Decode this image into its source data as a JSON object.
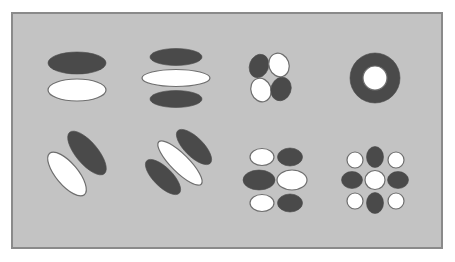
{
  "figure": {
    "width": 455,
    "height": 262,
    "background": "#ffffff",
    "panel": {
      "x": 12,
      "y": 13,
      "width": 430,
      "height": 235,
      "fill": "#c3c3c3",
      "stroke": "#8a8a8a",
      "stroke_width": 2
    },
    "colors": {
      "dark": "#4a4a4a",
      "light": "#ffffff",
      "outline": "#6e6e6e"
    },
    "patterns": [
      {
        "name": "two-lobe-horizontal",
        "shapes": [
          {
            "type": "ellipse",
            "cx": 77,
            "cy": 63,
            "rx": 29,
            "ry": 11,
            "rot": 0,
            "tone": "dark"
          },
          {
            "type": "ellipse",
            "cx": 77,
            "cy": 90,
            "rx": 29,
            "ry": 11,
            "rot": 0,
            "tone": "light"
          }
        ]
      },
      {
        "name": "three-lobe-horizontal",
        "shapes": [
          {
            "type": "ellipse",
            "cx": 176,
            "cy": 57,
            "rx": 26,
            "ry": 8.5,
            "rot": 0,
            "tone": "dark"
          },
          {
            "type": "ellipse",
            "cx": 176,
            "cy": 78,
            "rx": 34,
            "ry": 8.5,
            "rot": 0,
            "tone": "light"
          },
          {
            "type": "ellipse",
            "cx": 176,
            "cy": 99,
            "rx": 26,
            "ry": 8.5,
            "rot": 0,
            "tone": "dark"
          }
        ]
      },
      {
        "name": "four-lobe-quadrant",
        "shapes": [
          {
            "type": "ellipse",
            "cx": 259,
            "cy": 66,
            "rx": 9.5,
            "ry": 12,
            "rot": 20,
            "tone": "dark"
          },
          {
            "type": "ellipse",
            "cx": 279,
            "cy": 65,
            "rx": 10,
            "ry": 12,
            "rot": -20,
            "tone": "light"
          },
          {
            "type": "ellipse",
            "cx": 261,
            "cy": 90,
            "rx": 10,
            "ry": 12,
            "rot": -20,
            "tone": "light"
          },
          {
            "type": "ellipse",
            "cx": 281,
            "cy": 89,
            "rx": 10,
            "ry": 12,
            "rot": 20,
            "tone": "dark"
          }
        ]
      },
      {
        "name": "center-surround-ring",
        "shapes": [
          {
            "type": "circle",
            "cx": 375,
            "cy": 78,
            "r": 25,
            "tone": "dark"
          },
          {
            "type": "circle",
            "cx": 375,
            "cy": 78,
            "r": 12,
            "tone": "light"
          }
        ]
      },
      {
        "name": "two-lobe-diagonal",
        "shapes": [
          {
            "type": "ellipse",
            "cx": 67,
            "cy": 174,
            "rx": 27,
            "ry": 11,
            "rot": 50,
            "tone": "light"
          },
          {
            "type": "ellipse",
            "cx": 87,
            "cy": 153,
            "rx": 27,
            "ry": 11,
            "rot": 50,
            "tone": "dark"
          }
        ]
      },
      {
        "name": "three-lobe-diagonal",
        "shapes": [
          {
            "type": "ellipse",
            "cx": 163,
            "cy": 177,
            "rx": 23,
            "ry": 9.5,
            "rot": 45,
            "tone": "dark"
          },
          {
            "type": "ellipse",
            "cx": 180,
            "cy": 163,
            "rx": 30,
            "ry": 9,
            "rot": 45,
            "tone": "light"
          },
          {
            "type": "ellipse",
            "cx": 194,
            "cy": 147,
            "rx": 23,
            "ry": 9.5,
            "rot": 45,
            "tone": "dark"
          }
        ]
      },
      {
        "name": "six-lobe-grid",
        "shapes": [
          {
            "type": "ellipse",
            "cx": 262,
            "cy": 157,
            "rx": 12,
            "ry": 8.5,
            "rot": 0,
            "tone": "light"
          },
          {
            "type": "ellipse",
            "cx": 290,
            "cy": 157,
            "rx": 12.5,
            "ry": 9,
            "rot": 0,
            "tone": "dark"
          },
          {
            "type": "ellipse",
            "cx": 259,
            "cy": 180,
            "rx": 16,
            "ry": 10,
            "rot": 0,
            "tone": "dark"
          },
          {
            "type": "ellipse",
            "cx": 292,
            "cy": 180,
            "rx": 15,
            "ry": 10,
            "rot": 0,
            "tone": "light"
          },
          {
            "type": "ellipse",
            "cx": 262,
            "cy": 203,
            "rx": 12,
            "ry": 8.5,
            "rot": 0,
            "tone": "light"
          },
          {
            "type": "ellipse",
            "cx": 290,
            "cy": 203,
            "rx": 12.5,
            "ry": 9,
            "rot": 0,
            "tone": "dark"
          }
        ]
      },
      {
        "name": "nine-lobe-grid",
        "shapes": [
          {
            "type": "ellipse",
            "cx": 355,
            "cy": 160,
            "rx": 8,
            "ry": 8,
            "rot": 0,
            "tone": "light"
          },
          {
            "type": "ellipse",
            "cx": 375,
            "cy": 157,
            "rx": 8.5,
            "ry": 10.5,
            "rot": 0,
            "tone": "dark"
          },
          {
            "type": "ellipse",
            "cx": 396,
            "cy": 160,
            "rx": 8,
            "ry": 8,
            "rot": 0,
            "tone": "light"
          },
          {
            "type": "ellipse",
            "cx": 352,
            "cy": 180,
            "rx": 10.5,
            "ry": 8.5,
            "rot": 0,
            "tone": "dark"
          },
          {
            "type": "ellipse",
            "cx": 375,
            "cy": 180,
            "rx": 10,
            "ry": 9.5,
            "rot": 0,
            "tone": "light"
          },
          {
            "type": "ellipse",
            "cx": 398,
            "cy": 180,
            "rx": 10.5,
            "ry": 8.5,
            "rot": 0,
            "tone": "dark"
          },
          {
            "type": "ellipse",
            "cx": 355,
            "cy": 201,
            "rx": 8,
            "ry": 8,
            "rot": 0,
            "tone": "light"
          },
          {
            "type": "ellipse",
            "cx": 375,
            "cy": 203,
            "rx": 8.5,
            "ry": 10.5,
            "rot": 0,
            "tone": "dark"
          },
          {
            "type": "ellipse",
            "cx": 396,
            "cy": 201,
            "rx": 8,
            "ry": 8,
            "rot": 0,
            "tone": "light"
          }
        ]
      }
    ]
  }
}
